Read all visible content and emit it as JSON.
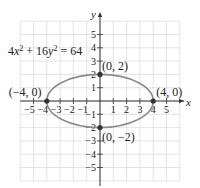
{
  "chart_data": {
    "type": "line",
    "title": "",
    "equation": "4x² + 16y² = 64",
    "xlabel": "x",
    "ylabel": "y",
    "xlim": [
      -5.5,
      5.5
    ],
    "ylim": [
      -5.5,
      5.5
    ],
    "grid": true,
    "x_ticks": [
      -5,
      -4,
      -3,
      -2,
      -1,
      1,
      2,
      3,
      4,
      5
    ],
    "y_ticks": [
      -5,
      -4,
      -3,
      -2,
      -1,
      1,
      2,
      3,
      4,
      5
    ],
    "x_tick_labels": [
      "−5",
      "−4",
      "−3",
      "−2",
      "−1",
      "1",
      "2",
      "3",
      "4",
      "5"
    ],
    "y_tick_labels": [
      "−5",
      "−4",
      "−3",
      "−2",
      "−1",
      "1",
      "2",
      "3",
      "4",
      "5"
    ],
    "series": [
      {
        "name": "ellipse",
        "shape": "ellipse",
        "center": [
          0,
          0
        ],
        "a": 4,
        "b": 2,
        "color": "#8a8a8a"
      }
    ],
    "points": [
      {
        "x": -4,
        "y": 0,
        "label": "(−4, 0)"
      },
      {
        "x": 4,
        "y": 0,
        "label": "(4, 0)"
      },
      {
        "x": 0,
        "y": 2,
        "label": "(0, 2)"
      },
      {
        "x": 0,
        "y": -2,
        "label": "(0, −2)"
      }
    ],
    "colors": {
      "axis": "#333333",
      "grid": "#d8d8d8",
      "curve": "#8a8a8a",
      "point": "#333333"
    }
  }
}
